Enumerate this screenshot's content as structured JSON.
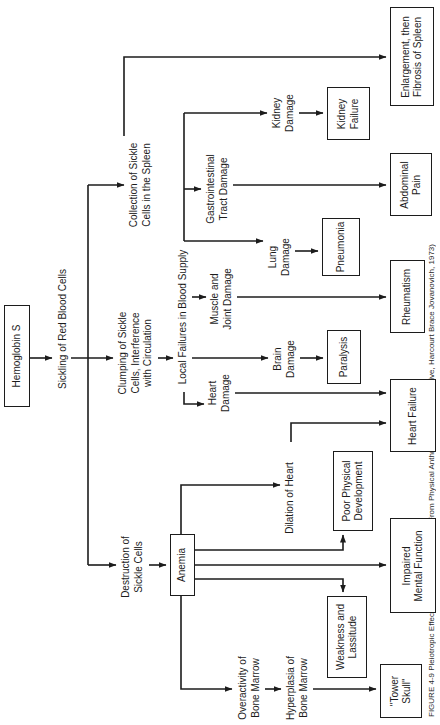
{
  "caption": {
    "text": "FIGURE 4-9   Pleiotropic Effects of Sickle-Cell Disease (From Physical Anthropology: A Perspective, Harcourt Brace Jovanovich, 1973)"
  },
  "diagram": {
    "line_color": "#1c1c1c",
    "nodes": [
      {
        "id": "hemoglobin-s",
        "kind": "box",
        "label": "Hemoglobin S",
        "cx": 369,
        "y": 4,
        "w": 102,
        "h": 26
      },
      {
        "id": "sickling",
        "kind": "label",
        "label": "Sickling of Red Blood Cells",
        "cx": 396,
        "y": 57
      },
      {
        "id": "clumping",
        "kind": "label",
        "label": "Clumping of Sickle\nCells, Interference\nwith Circulation",
        "cx": 372,
        "y": 117
      },
      {
        "id": "collection",
        "kind": "label",
        "label": "Collection of Sickle\nCells in the Spleen",
        "cx": 540,
        "y": 128
      },
      {
        "id": "destruction",
        "kind": "label",
        "label": "Destruction of\nSickle Cells",
        "cx": 158,
        "y": 120
      },
      {
        "id": "local-failures",
        "kind": "label",
        "label": "Local Failures in Blood Supply",
        "cx": 408,
        "y": 177
      },
      {
        "id": "heart-damage",
        "kind": "label",
        "label": "Heart\nDamage",
        "cx": 332,
        "y": 207
      },
      {
        "id": "brain-damage",
        "kind": "label",
        "label": "Brain\nDamage",
        "cx": 366,
        "y": 272
      },
      {
        "id": "muscle-joint-damage",
        "kind": "label",
        "label": "Muscle and\nJoint Damage",
        "cx": 426,
        "y": 209
      },
      {
        "id": "lung-damage",
        "kind": "label",
        "label": "Lung\nDamage",
        "cx": 468,
        "y": 267
      },
      {
        "id": "gi-damage",
        "kind": "label",
        "label": "Gastrointestinal\nTract Damage",
        "cx": 536,
        "y": 205
      },
      {
        "id": "kidney-damage",
        "kind": "label",
        "label": "Kidney\nDamage",
        "cx": 612,
        "y": 271
      },
      {
        "id": "dilation",
        "kind": "label",
        "label": "Dilation of Heart",
        "cx": 227,
        "y": 284
      },
      {
        "id": "overactivity",
        "kind": "label",
        "label": "Overactivity of\nBone Marrow",
        "cx": 37,
        "y": 237
      },
      {
        "id": "hyperplasia",
        "kind": "label",
        "label": "Hyperplasia of\nBone Marrow",
        "cx": 37,
        "y": 285
      },
      {
        "id": "anemia",
        "kind": "box",
        "label": "Anemia",
        "cx": 160,
        "y": 170,
        "w": 62,
        "h": 25
      },
      {
        "id": "tower-skull",
        "kind": "box",
        "label": "\"Tower\nSkull\"",
        "cx": 34,
        "y": 380,
        "w": 54,
        "h": 42
      },
      {
        "id": "weakness",
        "kind": "box",
        "label": "Weakness and\nLassitude",
        "cx": 88,
        "y": 327,
        "w": 82,
        "h": 40
      },
      {
        "id": "impaired",
        "kind": "box",
        "label": "Impaired\nMental Function",
        "cx": 159,
        "y": 390,
        "w": 95,
        "h": 46
      },
      {
        "id": "poor-physical",
        "kind": "box",
        "label": "Poor Physical\nDevelopment",
        "cx": 234,
        "y": 333,
        "w": 80,
        "h": 40
      },
      {
        "id": "heart-failure",
        "kind": "box",
        "label": "Heart Failure",
        "cx": 309,
        "y": 390,
        "w": 73,
        "h": 46
      },
      {
        "id": "paralysis",
        "kind": "box",
        "label": "Paralysis",
        "cx": 368,
        "y": 327,
        "w": 54,
        "h": 34
      },
      {
        "id": "rheumatism",
        "kind": "box",
        "label": "Rheumatism",
        "cx": 428,
        "y": 390,
        "w": 73,
        "h": 35
      },
      {
        "id": "pneumonia",
        "kind": "box",
        "label": "Pneumonia",
        "cx": 478,
        "y": 322,
        "w": 58,
        "h": 38
      },
      {
        "id": "abdominal-pain",
        "kind": "box",
        "label": "Abdominal\nPain",
        "cx": 540,
        "y": 390,
        "w": 63,
        "h": 42
      },
      {
        "id": "kidney-failure",
        "kind": "box",
        "label": "Kidney\nFailure",
        "cx": 611,
        "y": 327,
        "w": 53,
        "h": 43
      },
      {
        "id": "enlargement",
        "kind": "box",
        "label": "Enlargement, then\nFibrosis of Spleen",
        "cx": 668,
        "y": 390,
        "w": 99,
        "h": 44
      }
    ],
    "edges": [
      {
        "id": "hemoglobin-sickling",
        "points": [
          [
            367,
            30
          ],
          [
            367,
            52
          ]
        ],
        "arrow": true
      },
      {
        "id": "sickling-clumping",
        "points": [
          [
            367,
            71
          ],
          [
            367,
            113
          ]
        ],
        "arrow": true
      },
      {
        "id": "branch-line",
        "points": [
          [
            160,
            88
          ],
          [
            540,
            88
          ]
        ],
        "arrow": false
      },
      {
        "id": "branch-destruction",
        "points": [
          [
            160,
            88
          ],
          [
            160,
            116
          ]
        ],
        "arrow": true
      },
      {
        "id": "branch-collection",
        "points": [
          [
            540,
            88
          ],
          [
            540,
            124
          ]
        ],
        "arrow": true
      },
      {
        "id": "clumping-localfailures",
        "points": [
          [
            367,
            158
          ],
          [
            367,
            173
          ]
        ],
        "arrow": true
      },
      {
        "id": "localfailures-line",
        "points": [
          [
            484,
            184
          ],
          [
            612,
            184
          ]
        ],
        "arrow": false
      },
      {
        "id": "drop-heart",
        "points": [
          [
            333,
            184
          ],
          [
            321,
            184
          ],
          [
            321,
            204
          ]
        ],
        "arrow": true
      },
      {
        "id": "drop-brain",
        "points": [
          [
            367,
            192
          ],
          [
            367,
            268
          ]
        ],
        "arrow": true
      },
      {
        "id": "drop-muscle",
        "points": [
          [
            428,
            192
          ],
          [
            428,
            206
          ]
        ],
        "arrow": true
      },
      {
        "id": "drop-lung",
        "points": [
          [
            484,
            184
          ],
          [
            484,
            263
          ]
        ],
        "arrow": true
      },
      {
        "id": "drop-gi",
        "points": [
          [
            536,
            184
          ],
          [
            536,
            201
          ]
        ],
        "arrow": true
      },
      {
        "id": "drop-kidney",
        "points": [
          [
            612,
            184
          ],
          [
            612,
            267
          ]
        ],
        "arrow": true
      },
      {
        "id": "heartdamage-heartfailure",
        "points": [
          [
            332,
            235
          ],
          [
            332,
            386
          ]
        ],
        "arrow": true
      },
      {
        "id": "braindamage-paralysis",
        "points": [
          [
            367,
            300
          ],
          [
            367,
            323
          ]
        ],
        "arrow": true
      },
      {
        "id": "muscle-rheumatism",
        "points": [
          [
            428,
            237
          ],
          [
            428,
            386
          ]
        ],
        "arrow": true
      },
      {
        "id": "lung-pneumonia",
        "points": [
          [
            474,
            295
          ],
          [
            474,
            318
          ]
        ],
        "arrow": true
      },
      {
        "id": "gi-abdominal",
        "points": [
          [
            540,
            233
          ],
          [
            540,
            386
          ]
        ],
        "arrow": true
      },
      {
        "id": "kidney-kidneyfailure",
        "points": [
          [
            612,
            299
          ],
          [
            612,
            323
          ]
        ],
        "arrow": true
      },
      {
        "id": "collection-enlargement",
        "points": [
          [
            589,
            124
          ],
          [
            668,
            124
          ],
          [
            668,
            386
          ]
        ],
        "arrow": true
      },
      {
        "id": "destruction-anemia",
        "points": [
          [
            160,
            149
          ],
          [
            160,
            166
          ]
        ],
        "arrow": true
      },
      {
        "id": "anemia-dilation",
        "points": [
          [
            191,
            181
          ],
          [
            240,
            181
          ],
          [
            240,
            280
          ]
        ],
        "arrow": true
      },
      {
        "id": "dilation-heartfailure",
        "points": [
          [
            283,
            291
          ],
          [
            302,
            291
          ],
          [
            302,
            386
          ]
        ],
        "arrow": true
      },
      {
        "id": "anemia-poorphysical",
        "points": [
          [
            175,
            195
          ],
          [
            175,
            343
          ],
          [
            190,
            343
          ]
        ],
        "arrow": true
      },
      {
        "id": "anemia-impaired",
        "points": [
          [
            160,
            195
          ],
          [
            160,
            386
          ]
        ],
        "arrow": true
      },
      {
        "id": "anemia-weakness",
        "points": [
          [
            146,
            195
          ],
          [
            146,
            343
          ],
          [
            133,
            343
          ]
        ],
        "arrow": true
      },
      {
        "id": "anemia-overactivity",
        "points": [
          [
            129,
            181
          ],
          [
            36,
            181
          ],
          [
            36,
            232
          ]
        ],
        "arrow": true
      },
      {
        "id": "overactivity-hyperplasia",
        "points": [
          [
            36,
            265
          ],
          [
            36,
            281
          ]
        ],
        "arrow": true
      },
      {
        "id": "hyperplasia-towerskull",
        "points": [
          [
            36,
            313
          ],
          [
            36,
            376
          ]
        ],
        "arrow": true
      }
    ]
  }
}
